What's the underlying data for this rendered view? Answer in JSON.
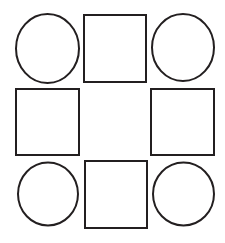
{
  "canvas": {
    "width": 225,
    "height": 243,
    "background_color": "#ffffff"
  },
  "style": {
    "stroke_color": "#231f20",
    "fill_color": "#ffffff",
    "stroke_width": 2
  },
  "diagram": {
    "type": "shape-grid",
    "rows": 3,
    "columns": 3,
    "center_is_empty": true,
    "shape_counts": {
      "circle": 4,
      "square": 4,
      "empty": 1
    },
    "cells": [
      {
        "id": "cell-top-left",
        "row": 1,
        "column": 1,
        "shape": "circle",
        "cx": 47.5,
        "cy": 48.5,
        "rx": 31.5,
        "ry": 34.5
      },
      {
        "id": "cell-top-center",
        "row": 1,
        "column": 2,
        "shape": "square",
        "x": 84,
        "y": 15,
        "width": 62,
        "height": 67
      },
      {
        "id": "cell-top-right",
        "row": 1,
        "column": 3,
        "shape": "circle",
        "cx": 183,
        "cy": 47.5,
        "rx": 31,
        "ry": 33.5
      },
      {
        "id": "cell-middle-left",
        "row": 2,
        "column": 1,
        "shape": "square",
        "x": 16,
        "y": 89,
        "width": 63,
        "height": 66
      },
      {
        "id": "cell-middle-center",
        "row": 2,
        "column": 2,
        "shape": "empty",
        "x": 85,
        "y": 89,
        "width": 61,
        "height": 66
      },
      {
        "id": "cell-middle-right",
        "row": 2,
        "column": 3,
        "shape": "square",
        "x": 151,
        "y": 89,
        "width": 63,
        "height": 66
      },
      {
        "id": "cell-bottom-left",
        "row": 3,
        "column": 1,
        "shape": "circle",
        "cx": 48,
        "cy": 194,
        "rx": 30,
        "ry": 31.5
      },
      {
        "id": "cell-bottom-center",
        "row": 3,
        "column": 2,
        "shape": "square",
        "x": 85,
        "y": 161,
        "width": 62,
        "height": 67
      },
      {
        "id": "cell-bottom-right",
        "row": 3,
        "column": 3,
        "shape": "circle",
        "cx": 183.5,
        "cy": 194,
        "rx": 30.5,
        "ry": 31.5
      }
    ]
  }
}
